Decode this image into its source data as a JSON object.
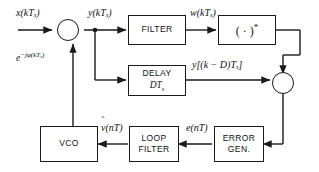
{
  "diagram": {
    "stroke_color": "#1a1a1a",
    "background": "#ffffff",
    "blocks": [
      {
        "id": "filter",
        "name": "filter-block",
        "line1": "FILTER",
        "line2": ""
      },
      {
        "id": "conjugate",
        "name": "conjugate-block",
        "line1": "( · )",
        "line2": "*"
      },
      {
        "id": "delay",
        "name": "delay-block",
        "line1": "DELAY",
        "line2": "DT",
        "line2_sub": "s"
      },
      {
        "id": "error_gen",
        "name": "error-generator-block",
        "line1": "ERROR",
        "line2": "GEN."
      },
      {
        "id": "loop_filter",
        "name": "loop-filter-block",
        "line1": "LOOP",
        "line2": "FILTER"
      },
      {
        "id": "vco",
        "name": "vco-block",
        "line1": "VCO",
        "line2": ""
      }
    ],
    "multipliers": [
      {
        "id": "mult_in",
        "name": "input-multiplier",
        "symbol": "x"
      },
      {
        "id": "mult_out",
        "name": "output-multiplier",
        "symbol": "x"
      }
    ],
    "labels": {
      "input": {
        "fn": "x",
        "arg": "(kT",
        "sub": "s",
        "close": ")"
      },
      "derotated": {
        "fn": "y",
        "arg": "(kT",
        "sub": "s",
        "close": ")"
      },
      "phasor": {
        "base": "e",
        "exp_sign": "−jφ(kT",
        "exp_sub": "s",
        "exp_close": ")"
      },
      "filtered": {
        "fn": "w",
        "arg": "(kT",
        "sub": "s",
        "close": ")"
      },
      "delayed": {
        "fn": "y",
        "arg": "[(k − D)T",
        "sub": "s",
        "close": "]"
      },
      "error": {
        "fn": "e",
        "arg": "(nT",
        "sub": "",
        "close": ")"
      },
      "vco_control": {
        "fn": "v",
        "hat": "ˆ",
        "arg": "(nT",
        "sub": "",
        "close": ")"
      }
    }
  }
}
